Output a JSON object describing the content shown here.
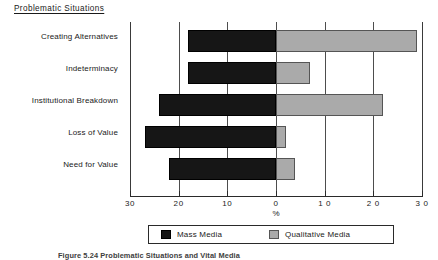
{
  "figure": {
    "section_title": "Problematic  Situations",
    "caption": "Figure 5.24  Problematic Situations and Vital Media"
  },
  "chart_data": {
    "type": "bar",
    "orientation": "horizontal",
    "layout": "diverging",
    "title": "Problematic  Situations",
    "xlabel": "%",
    "ylabel": "",
    "xlim": [
      -30,
      30
    ],
    "grid": true,
    "legend_position": "bottom",
    "axis_ticks": [
      {
        "label": "30",
        "value": -30
      },
      {
        "label": "20",
        "value": -20
      },
      {
        "label": "10",
        "value": -10
      },
      {
        "label": "0",
        "value": 0
      },
      {
        "label": "1 0",
        "value": 10
      },
      {
        "label": "2 0",
        "value": 20
      },
      {
        "label": "3 0",
        "value": 30
      }
    ],
    "categories": [
      "Creating Alternatives",
      "Indeterminacy",
      "Institutional Breakdown",
      "Loss of Value",
      "Need for Value"
    ],
    "series": [
      {
        "name": "Mass Media",
        "color": "#161616",
        "direction": "left",
        "values": [
          18,
          18,
          24,
          27,
          22
        ]
      },
      {
        "name": "Qualitative Media",
        "color": "#aaaaaa",
        "direction": "right",
        "values": [
          29,
          7,
          22,
          2,
          4
        ]
      }
    ]
  }
}
